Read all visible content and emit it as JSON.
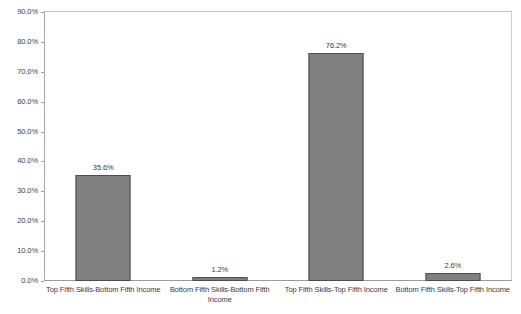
{
  "chart_data": {
    "type": "bar",
    "title": "",
    "xlabel": "",
    "ylabel": "",
    "categories": [
      "Top Fifth Skills-Bottom Fifth Income",
      "Bottom Fifth Skills-Bottom Fifth Income",
      "Top Fifth Skills-Top Fifth Income",
      "Bottom Fifth Skills-Top Fifth Income"
    ],
    "values": [
      35.6,
      1.2,
      76.2,
      2.6
    ],
    "value_labels": [
      "35.6%",
      "1.2%",
      "76.2%",
      "2.6%"
    ],
    "ylim": [
      0,
      90
    ],
    "ytick_values": [
      0,
      10,
      20,
      30,
      40,
      50,
      60,
      70,
      80,
      90
    ],
    "ytick_labels": [
      "0.0%",
      "10.0%",
      "20.0%",
      "30.0%",
      "40.0%",
      "50.0%",
      "60.0%",
      "70.0%",
      "80.0%",
      "90.0%"
    ],
    "grid": false,
    "legend": false,
    "bar_color": "#808080",
    "bar_border_color": "#4d4d4d",
    "frame_color": "#b9b9b9",
    "background": "#ffffff"
  }
}
